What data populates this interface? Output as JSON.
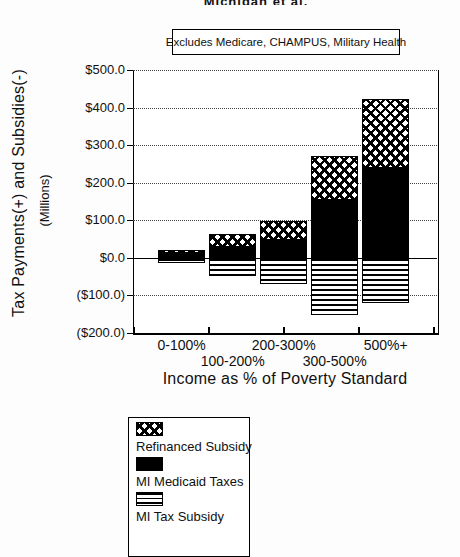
{
  "header": {
    "cropped_text": "Michigan et al.",
    "note_box": "Excludes Medicare, CHAMPUS, Military Health"
  },
  "chart_data": {
    "type": "bar",
    "stacked": true,
    "title": "",
    "note": "Excludes Medicare, CHAMPUS, Military Health",
    "categories": [
      "0-100%",
      "100-200%",
      "200-300%",
      "300-500%",
      "500%+"
    ],
    "series": [
      {
        "name": "Refinanced Subsidy",
        "pattern": "crosshatch",
        "values": [
          8,
          33,
          49,
          117,
          183
        ]
      },
      {
        "name": "MI Medicaid Taxes",
        "pattern": "solid-black",
        "values": [
          14,
          30,
          48,
          154,
          240
        ]
      },
      {
        "name": "MI Tax Subsidy",
        "pattern": "horizontal-lines",
        "values": [
          -15,
          -47,
          -70,
          -152,
          -121
        ]
      }
    ],
    "xlabel": "Income as % of Poverty Standard",
    "ylabel": "Tax Payments(+) and Subsidies(-)",
    "ylabel2": "(Millions)",
    "ylim": [
      -200,
      500
    ],
    "ytick_step": 100,
    "ytick_labels": [
      "$500.0",
      "$400.0",
      "$300.0",
      "$200.0",
      "$100.0",
      "$0.0",
      "($100.0)",
      "($200.0)"
    ],
    "grid": "dotted-horizontal",
    "legend_position": "bottom-left",
    "colors": {
      "ink": "#000000",
      "paper": "#ffffff"
    }
  }
}
